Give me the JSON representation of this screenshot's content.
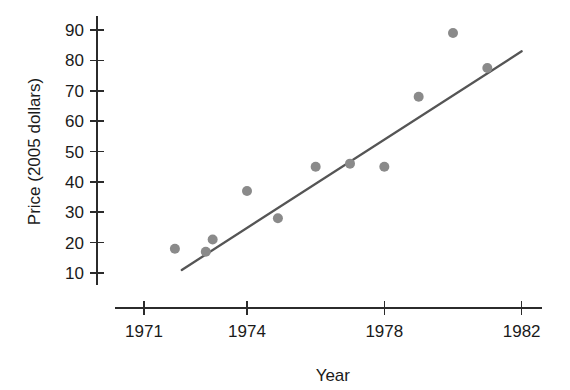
{
  "chart_data": {
    "type": "scatter",
    "title": "",
    "xlabel": "Year",
    "ylabel": "Price (2005 dollars)",
    "xlim": [
      1971,
      1982.6
    ],
    "ylim": [
      7,
      92
    ],
    "grid": false,
    "legend": "none",
    "x_ticks": [
      1971,
      1974,
      1978,
      1982
    ],
    "x_tick_labels": [
      "1971",
      "1974",
      "1978",
      "1982"
    ],
    "x_minor_ticks": [],
    "y_ticks": [
      10,
      20,
      30,
      40,
      50,
      60,
      70,
      80,
      90
    ],
    "y_tick_labels": [
      "10",
      "20",
      "30",
      "40",
      "50",
      "60",
      "70",
      "80",
      "90"
    ],
    "marker_color": "#8a8a8a",
    "marker_size": 10,
    "line_color": "#555555",
    "axis_color": "#2b2b2b",
    "points": [
      {
        "x": 1971.9,
        "y": 18
      },
      {
        "x": 1972.8,
        "y": 17
      },
      {
        "x": 1973.0,
        "y": 21
      },
      {
        "x": 1974.0,
        "y": 37
      },
      {
        "x": 1974.9,
        "y": 28
      },
      {
        "x": 1976.0,
        "y": 45
      },
      {
        "x": 1977.0,
        "y": 46
      },
      {
        "x": 1978.0,
        "y": 45
      },
      {
        "x": 1979.0,
        "y": 68
      },
      {
        "x": 1980.0,
        "y": 89
      },
      {
        "x": 1981.0,
        "y": 77.5
      }
    ],
    "fit_line": {
      "label": "least-squares fit",
      "x_start": 1972.1,
      "y_start": 11,
      "x_end": 1982.0,
      "y_end": 83
    }
  },
  "axis": {
    "x_title": "Year",
    "y_title": "Price (2005 dollars)"
  }
}
